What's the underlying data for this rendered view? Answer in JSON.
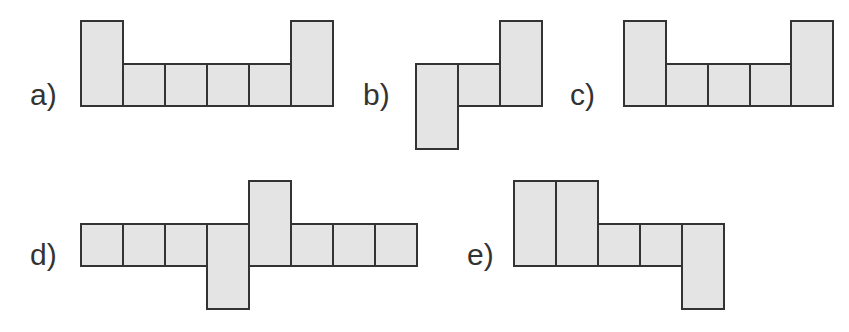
{
  "options": [
    {
      "label": "a)",
      "lx": 30,
      "ly": 78,
      "cells": [
        [
          80,
          20,
          42,
          87
        ],
        [
          122,
          63,
          42,
          44
        ],
        [
          164,
          63,
          42,
          44
        ],
        [
          206,
          63,
          42,
          44
        ],
        [
          248,
          63,
          42,
          44
        ],
        [
          290,
          20,
          42,
          87
        ]
      ]
    },
    {
      "label": "b)",
      "lx": 363,
      "ly": 78,
      "cells": [
        [
          415,
          63,
          42,
          87
        ],
        [
          457,
          63,
          42,
          44
        ],
        [
          499,
          20,
          42,
          87
        ]
      ]
    },
    {
      "label": "c)",
      "lx": 570,
      "ly": 78,
      "cells": [
        [
          623,
          20,
          42,
          87
        ],
        [
          665,
          63,
          42,
          44
        ],
        [
          707,
          63,
          42,
          44
        ],
        [
          749,
          63,
          42,
          44
        ],
        [
          790,
          20,
          42,
          87
        ]
      ]
    },
    {
      "label": "d)",
      "lx": 30,
      "ly": 238,
      "cells": [
        [
          80,
          223,
          42,
          44
        ],
        [
          122,
          223,
          42,
          44
        ],
        [
          164,
          223,
          42,
          44
        ],
        [
          206,
          223,
          42,
          87
        ],
        [
          248,
          180,
          42,
          87
        ],
        [
          290,
          223,
          42,
          44
        ],
        [
          332,
          223,
          42,
          44
        ],
        [
          374,
          223,
          42,
          44
        ]
      ]
    },
    {
      "label": "e)",
      "lx": 467,
      "ly": 238,
      "cells": [
        [
          513,
          180,
          42,
          87
        ],
        [
          555,
          180,
          42,
          87
        ],
        [
          597,
          223,
          42,
          44
        ],
        [
          639,
          223,
          42,
          44
        ],
        [
          681,
          223,
          42,
          87
        ]
      ]
    }
  ]
}
